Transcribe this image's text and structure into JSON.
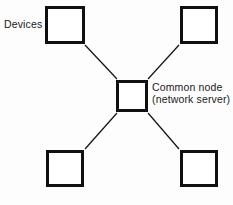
{
  "diagram": {
    "type": "star-topology",
    "background_color": "#fdfdfd",
    "stroke_color": "#101010",
    "labels": {
      "devices": "Devices",
      "common_node_line1": "Common node",
      "common_node_line2": "(network server)"
    },
    "nodes": [
      {
        "id": "device-top-left",
        "kind": "device",
        "x": 45,
        "y": 6,
        "w": 40,
        "h": 38
      },
      {
        "id": "device-top-right",
        "kind": "device",
        "x": 180,
        "y": 6,
        "w": 38,
        "h": 38
      },
      {
        "id": "device-bottom-left",
        "kind": "device",
        "x": 46,
        "y": 150,
        "w": 38,
        "h": 37
      },
      {
        "id": "device-bottom-right",
        "kind": "device",
        "x": 180,
        "y": 150,
        "w": 38,
        "h": 37
      },
      {
        "id": "common-node",
        "kind": "common-node",
        "x": 116,
        "y": 80,
        "w": 32,
        "h": 32
      }
    ],
    "links": [
      {
        "from": "device-top-left",
        "to": "common-node",
        "x1": 85,
        "y1": 45,
        "x2": 117,
        "y2": 79
      },
      {
        "from": "device-top-right",
        "to": "common-node",
        "x1": 179,
        "y1": 45,
        "x2": 148,
        "y2": 79
      },
      {
        "from": "device-bottom-left",
        "to": "common-node",
        "x1": 85,
        "y1": 149,
        "x2": 117,
        "y2": 113
      },
      {
        "from": "device-bottom-right",
        "to": "common-node",
        "x1": 179,
        "y1": 149,
        "x2": 148,
        "y2": 113
      }
    ]
  }
}
